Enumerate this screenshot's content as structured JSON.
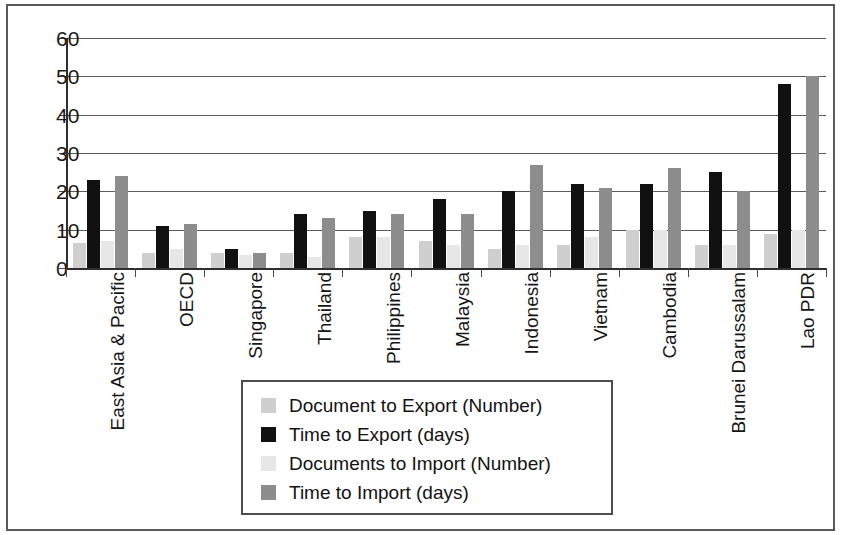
{
  "figure": {
    "background": "#ffffff",
    "frame_color": "#5a5a5a"
  },
  "chart_data": {
    "type": "bar",
    "title": "",
    "subtitle": "",
    "xlabel": "",
    "ylabel": "",
    "ylim": [
      0,
      60
    ],
    "yticks": [
      0,
      10,
      20,
      30,
      40,
      50,
      60
    ],
    "grid": true,
    "legend_position": "below-center",
    "categories": [
      "East Asia & Pacific",
      "OECD",
      "Singapore",
      "Thailand",
      "Philippines",
      "Malaysia",
      "Indonesia",
      "Vietnam",
      "Cambodia",
      "Brunei Darussalam",
      "Lao PDR"
    ],
    "series": [
      {
        "name": "Document to Export (Number)",
        "color": "#cfcfcf",
        "values": [
          6.5,
          4,
          4,
          4,
          8,
          7,
          5,
          6,
          10,
          6,
          9
        ]
      },
      {
        "name": "Time to Export (days)",
        "color": "#111111",
        "values": [
          23,
          11,
          5,
          14,
          15,
          18,
          20,
          22,
          22,
          25,
          48
        ]
      },
      {
        "name": "Documents to Import (Number)",
        "color": "#e7e7e7",
        "values": [
          7,
          5,
          3.5,
          3,
          8,
          6,
          6,
          8,
          10,
          6,
          10
        ]
      },
      {
        "name": "Time to Import (days)",
        "color": "#8d8d8d",
        "values": [
          24,
          11.5,
          4,
          13,
          14,
          14,
          27,
          21,
          26,
          20,
          50
        ]
      }
    ]
  }
}
